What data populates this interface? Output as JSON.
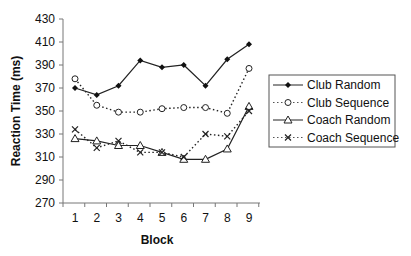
{
  "chart_data": {
    "type": "line",
    "title": "",
    "xlabel": "Block",
    "ylabel": "Reaction Time (ms)",
    "x": [
      1,
      2,
      3,
      4,
      5,
      6,
      7,
      8,
      9
    ],
    "yticks": [
      270,
      290,
      310,
      330,
      350,
      370,
      390,
      410,
      430
    ],
    "ylim": [
      270,
      430
    ],
    "grid": false,
    "legend_position": "right",
    "series": [
      {
        "name": "Club Random",
        "line": "solid",
        "marker": "filled-diamond",
        "values": [
          370,
          364,
          372,
          394,
          388,
          390,
          372,
          395,
          408
        ]
      },
      {
        "name": "Club Sequence",
        "line": "dotted",
        "marker": "open-circle",
        "values": [
          378,
          355,
          349,
          349,
          352,
          353,
          353,
          348,
          387
        ]
      },
      {
        "name": "Coach Random",
        "line": "solid",
        "marker": "open-triangle",
        "values": [
          326,
          324,
          320,
          320,
          314,
          308,
          308,
          317,
          354
        ]
      },
      {
        "name": "Coach Sequence",
        "line": "dotted",
        "marker": "x",
        "values": [
          334,
          318,
          324,
          314,
          314,
          310,
          330,
          328,
          350
        ]
      }
    ]
  }
}
